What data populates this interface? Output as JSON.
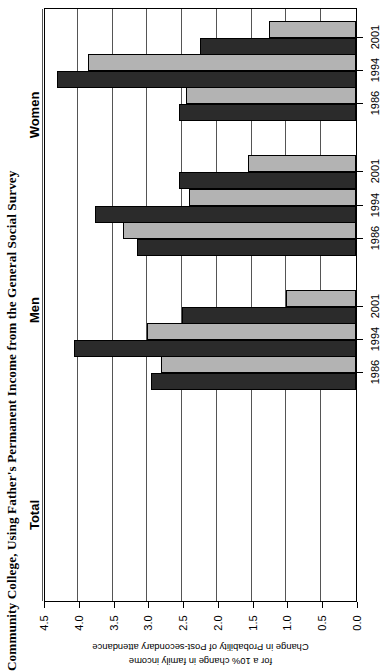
{
  "chart_data": {
    "type": "bar",
    "title": "Community College, Using Father's Permanent Income from the General Social Survey",
    "xlabel": "",
    "ylabel": "Change in Probability of Post-secondary attendance for a 10% change in family income",
    "ylabel_line1": "Change in Probability of Post-secondary attendance",
    "ylabel_line2": "for a 10% change in family income",
    "orientation": "horizontal",
    "value_axis_ticks": [
      "0.0",
      "0.5",
      "1.0",
      "1.5",
      "2.0",
      "2.5",
      "3.0",
      "3.5",
      "4.0",
      "4.5"
    ],
    "value_axis_tick_values": [
      0.0,
      0.5,
      1.0,
      1.5,
      2.0,
      2.5,
      3.0,
      3.5,
      4.0,
      4.5
    ],
    "xlim": [
      0.0,
      4.5
    ],
    "grid": true,
    "legend": "none",
    "groups": [
      "Total",
      "Men",
      "Women"
    ],
    "categories": [
      "1986",
      "1994",
      "2001"
    ],
    "series": [
      {
        "name": "dark",
        "color": "#2b2b2b",
        "values": {
          "Total": [
            2.95,
            4.05,
            2.5
          ],
          "Men": [
            3.15,
            3.75,
            2.55
          ],
          "Women": [
            2.55,
            4.3,
            2.25
          ]
        }
      },
      {
        "name": "light",
        "color": "#b3b3b3",
        "values": {
          "Total": [
            2.8,
            3.0,
            1.0
          ],
          "Men": [
            3.35,
            2.4,
            1.55
          ],
          "Women": [
            2.45,
            3.85,
            1.25
          ]
        }
      }
    ],
    "bars": [
      {
        "group": "Women",
        "year": "2001",
        "series": "light",
        "value": 1.25
      },
      {
        "group": "Women",
        "year": "2001",
        "series": "dark",
        "value": 2.25
      },
      {
        "group": "Women",
        "year": "1994",
        "series": "light",
        "value": 3.85
      },
      {
        "group": "Women",
        "year": "1994",
        "series": "dark",
        "value": 4.3
      },
      {
        "group": "Women",
        "year": "1986",
        "series": "light",
        "value": 2.45
      },
      {
        "group": "Women",
        "year": "1986",
        "series": "dark",
        "value": 2.55
      },
      {
        "group": "Men",
        "year": "2001",
        "series": "light",
        "value": 1.55
      },
      {
        "group": "Men",
        "year": "2001",
        "series": "dark",
        "value": 2.55
      },
      {
        "group": "Men",
        "year": "1994",
        "series": "light",
        "value": 2.4
      },
      {
        "group": "Men",
        "year": "1994",
        "series": "dark",
        "value": 3.75
      },
      {
        "group": "Men",
        "year": "1986",
        "series": "light",
        "value": 3.35
      },
      {
        "group": "Men",
        "year": "1986",
        "series": "dark",
        "value": 3.15
      },
      {
        "group": "Total",
        "year": "2001",
        "series": "light",
        "value": 1.0
      },
      {
        "group": "Total",
        "year": "2001",
        "series": "dark",
        "value": 2.5
      },
      {
        "group": "Total",
        "year": "1994",
        "series": "light",
        "value": 3.0
      },
      {
        "group": "Total",
        "year": "1994",
        "series": "dark",
        "value": 4.05
      },
      {
        "group": "Total",
        "year": "1986",
        "series": "light",
        "value": 2.8
      },
      {
        "group": "Total",
        "year": "1986",
        "series": "dark",
        "value": 2.95
      }
    ]
  },
  "group_labels": [
    {
      "label": "Women",
      "top": 40,
      "height": 150
    },
    {
      "label": "Men",
      "top": 250,
      "height": 120
    },
    {
      "label": "Total",
      "top": 455,
      "height": 120
    }
  ],
  "year_labels": [
    "2001",
    "1994",
    "1986",
    "2001",
    "1994",
    "1986",
    "2001",
    "1994",
    "1986"
  ]
}
